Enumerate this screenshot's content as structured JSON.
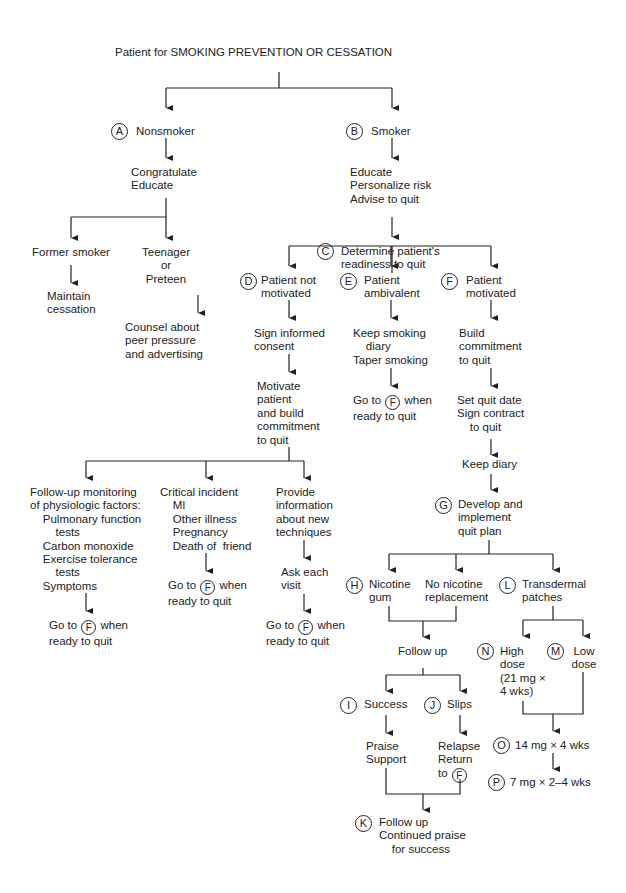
{
  "title": "Patient for SMOKING PREVENTION OR CESSATION",
  "nodes": {
    "A": {
      "badge": "A",
      "text": "Nonsmoker"
    },
    "A1": {
      "text": "Congratulate\nEducate"
    },
    "A2": {
      "text": "Former smoker"
    },
    "A2a": {
      "text": "Maintain\ncessation"
    },
    "A3": {
      "text": "Teenager\nor\nPreteen"
    },
    "A3a": {
      "text": "Counsel about\npeer pressure\nand advertising"
    },
    "B": {
      "badge": "B",
      "text": "Smoker"
    },
    "B1": {
      "text": "Educate\nPersonalize risk\nAdvise to quit"
    },
    "C": {
      "badge": "C",
      "text": "Determine patient's\nreadiness to quit"
    },
    "D": {
      "badge": "D",
      "text": "Patient not\nmotivated"
    },
    "D1": {
      "text": "Sign informed\nconsent"
    },
    "D2": {
      "text": "Motivate\npatient\nand build\ncommitment\nto quit"
    },
    "D3": {
      "text": "Follow-up monitoring\nof physiologic factors:\n    Pulmonary function\n        tests\n    Carbon monoxide\n    Exercise tolerance\n        tests\n    Symptoms"
    },
    "D3a": {
      "pre": "Go to ",
      "ref": "F",
      "post": " when\nready to quit"
    },
    "D4": {
      "text": "Critical incident\n    MI\n    Other illness\n    Pregnancy\n    Death of  friend"
    },
    "D4a": {
      "pre": "Go to ",
      "ref": "F",
      "post": " when\nready to quit"
    },
    "D5": {
      "text": "Provide\ninformation\nabout new\ntechniques"
    },
    "D5a": {
      "text": "Ask each\nvisit"
    },
    "D5b": {
      "pre": "Go to ",
      "ref": "F",
      "post": " when\nready to quit"
    },
    "E": {
      "badge": "E",
      "text": "Patient\nambivalent"
    },
    "E1": {
      "text": "Keep smoking\n    diary\nTaper smoking"
    },
    "E2": {
      "pre": "Go to ",
      "ref": "F",
      "post": " when\nready to quit"
    },
    "F": {
      "badge": "F",
      "text": "Patient\nmotivated"
    },
    "F1": {
      "text": "Build\ncommitment\nto quit"
    },
    "F2": {
      "text": "Set quit date\nSign contract\n    to quit"
    },
    "F3": {
      "text": "Keep diary"
    },
    "G": {
      "badge": "G",
      "text": "Develop and\nimplement\nquit plan"
    },
    "H": {
      "badge": "H",
      "text": "Nicotine\ngum"
    },
    "H2": {
      "text": "No nicotine\nreplacement"
    },
    "FU": {
      "text": "Follow up"
    },
    "I": {
      "badge": "I",
      "text": "Success"
    },
    "I1": {
      "text": "Praise\nSupport"
    },
    "J": {
      "badge": "J",
      "text": "Slips"
    },
    "J1": {
      "text": "Relapse\nReturn\nto ",
      "ref": "F"
    },
    "K": {
      "badge": "K",
      "text": "Follow up\nContinued praise\n    for success"
    },
    "L": {
      "badge": "L",
      "text": "Transdermal\npatches"
    },
    "N": {
      "badge": "N",
      "text": "High\ndose\n(21 mg ×\n4 wks)"
    },
    "M": {
      "badge": "M",
      "text": "Low\ndose"
    },
    "O": {
      "badge": "O",
      "text": "14 mg × 4 wks"
    },
    "P": {
      "badge": "P",
      "text": "7 mg × 2–4 wks"
    }
  },
  "colors": {
    "line": "#222222",
    "text": "#222222",
    "background": "#ffffff"
  }
}
